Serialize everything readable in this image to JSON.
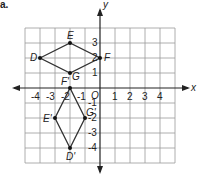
{
  "part_label": "a.",
  "axes": {
    "x_label": "x",
    "y_label": "y",
    "origin_label": "O",
    "x_ticks": [
      "-4",
      "-3",
      "-2",
      "-1",
      "1",
      "2",
      "3",
      "4"
    ],
    "y_ticks": [
      "3",
      "2",
      "1",
      "-1",
      "-2",
      "-3",
      "-4"
    ]
  },
  "original": {
    "vertices": [
      {
        "name": "D",
        "x": -4,
        "y": 2
      },
      {
        "name": "E",
        "x": -2,
        "y": 3
      },
      {
        "name": "F",
        "x": 0,
        "y": 2
      },
      {
        "name": "G",
        "x": -2,
        "y": 1
      }
    ]
  },
  "image": {
    "vertices": [
      {
        "name": "D'",
        "x": -2,
        "y": -4
      },
      {
        "name": "E'",
        "x": -3,
        "y": -2
      },
      {
        "name": "F'",
        "x": -2,
        "y": 0
      },
      {
        "name": "G'",
        "x": -1,
        "y": -2
      }
    ]
  },
  "colors": {
    "grid": "#9a9a9a",
    "axis": "#222222",
    "shape": "#333333"
  }
}
